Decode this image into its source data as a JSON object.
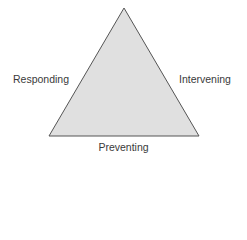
{
  "diagram": {
    "shape": "triangle",
    "fill_color": "#e0e0e0",
    "stroke_color": "#555555",
    "labels": {
      "left": "Responding",
      "right": "Intervening",
      "bottom": "Preventing"
    }
  }
}
